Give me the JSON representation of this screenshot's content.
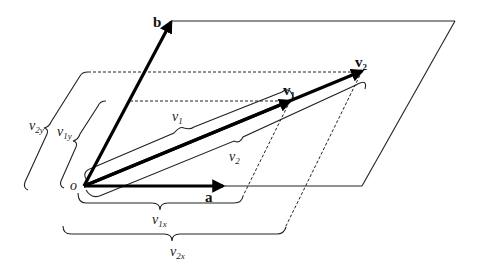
{
  "diagram": {
    "origin_label": "o",
    "vectors": {
      "a": {
        "label": "a"
      },
      "b": {
        "label": "b"
      },
      "v1": {
        "label": "v",
        "subscript": "1"
      },
      "v2": {
        "label": "v",
        "subscript": "2"
      }
    },
    "braces": {
      "v1_length": {
        "label": "v",
        "subscript": "1"
      },
      "v2_length": {
        "label": "v",
        "subscript": "2"
      },
      "v1x": {
        "label": "v",
        "subscript": "1x"
      },
      "v2x": {
        "label": "v",
        "subscript": "2x"
      },
      "v1y": {
        "label": "v",
        "subscript": "1y"
      },
      "v2y": {
        "label": "v",
        "subscript": "2y"
      }
    },
    "colors": {
      "line": "#222222",
      "vector": "#000000",
      "background": "#ffffff"
    }
  }
}
